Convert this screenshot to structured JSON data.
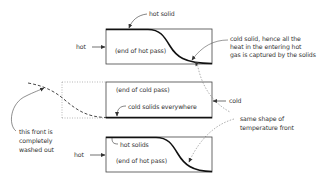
{
  "diagram": {
    "panels": [
      {
        "id": "top",
        "inlet_label": "hot",
        "caption": "(end of hot pass)",
        "curve_label": "hot solid"
      },
      {
        "id": "middle",
        "inlet_label": "cold",
        "caption": "(end of cold pass)",
        "curve_label": "cold solids everywhere"
      },
      {
        "id": "bottom",
        "inlet_label": "hot",
        "caption": "(end of hot pass)",
        "curve_label": "hot solids"
      }
    ],
    "annotations": {
      "cold_solid_note": [
        "cold solid, hence all the",
        "heat in the entering hot",
        "gas is captured by the solids"
      ],
      "washed_out_note": [
        "this front is",
        "completely",
        "washed out"
      ],
      "same_shape_note": [
        "same shape of",
        "temperature front"
      ]
    },
    "colors": {
      "line": "#222222",
      "text": "#333333",
      "dashed": "#555555",
      "dotted": "#888888"
    }
  }
}
